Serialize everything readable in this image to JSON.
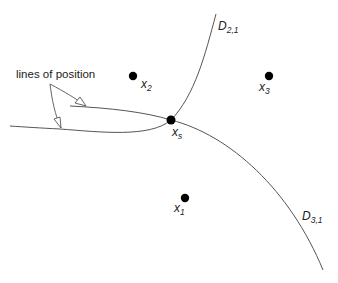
{
  "diagram": {
    "callout_label": "lines of position",
    "points": [
      {
        "id": "x2",
        "base": "x",
        "sub": "2"
      },
      {
        "id": "x3",
        "base": "x",
        "sub": "3"
      },
      {
        "id": "xs",
        "base": "x",
        "sub": "s"
      },
      {
        "id": "x1",
        "base": "x",
        "sub": "1"
      }
    ],
    "curves": [
      {
        "id": "D21",
        "base": "D",
        "sub": "2,1"
      },
      {
        "id": "D31",
        "base": "D",
        "sub": "3,1"
      }
    ],
    "colors": {
      "line": "#555555",
      "point": "#000000",
      "text": "#222222"
    }
  }
}
